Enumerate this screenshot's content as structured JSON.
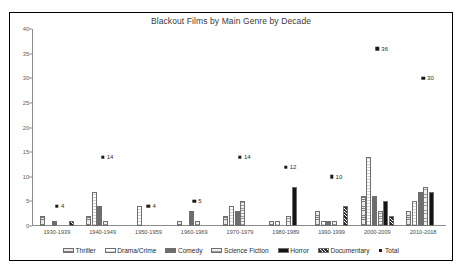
{
  "chart_data": {
    "type": "bar",
    "title": "Blackout Films by Main Genre by Decade",
    "xlabel": "",
    "ylabel": "",
    "ylim": [
      0,
      40
    ],
    "ytick_step": 5,
    "yticks": [
      "0",
      "5",
      "10",
      "15",
      "20",
      "25",
      "30",
      "35",
      "40"
    ],
    "grid": false,
    "legend_position": "bottom",
    "categories": [
      "1930-1939",
      "1940-1949",
      "1950-1959",
      "1960-1969",
      "1970-1979",
      "1980-1989",
      "1990-1999",
      "2000-2009",
      "2010-2018"
    ],
    "series": [
      {
        "name": "Thriller",
        "pattern": "horizontal-hatch",
        "values": [
          2,
          2,
          0,
          1,
          2,
          1,
          3,
          6,
          3
        ]
      },
      {
        "name": "Drama/Crime",
        "pattern": "outline-white",
        "values": [
          0,
          7,
          4,
          0,
          4,
          1,
          1,
          14,
          5
        ]
      },
      {
        "name": "Comedy",
        "pattern": "solid-dark-gray",
        "values": [
          1,
          4,
          0,
          3,
          3,
          0,
          1,
          6,
          7
        ]
      },
      {
        "name": "Science Fiction",
        "pattern": "fine-hatch",
        "values": [
          0,
          1,
          0,
          1,
          5,
          2,
          1,
          3,
          8
        ]
      },
      {
        "name": "Horror",
        "pattern": "solid-black",
        "values": [
          0,
          0,
          0,
          0,
          0,
          8,
          0,
          5,
          7
        ]
      },
      {
        "name": "Documentary",
        "pattern": "cross-hatch",
        "values": [
          1,
          0,
          0,
          0,
          0,
          0,
          4,
          2,
          0
        ]
      }
    ],
    "total_series": {
      "name": "Total",
      "marker": "square",
      "values": [
        4,
        14,
        4,
        5,
        14,
        12,
        10,
        36,
        30
      ],
      "labels": [
        "4",
        "14",
        "4",
        "5",
        "14",
        "12",
        "10",
        "36",
        "30"
      ]
    }
  }
}
